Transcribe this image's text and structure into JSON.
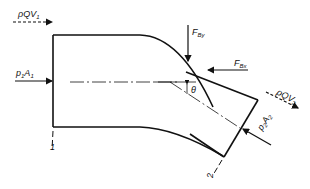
{
  "diagram": {
    "labels": {
      "momentum_in": "ρQV",
      "momentum_in_sub": "1",
      "pressure_in": "p",
      "pressure_in_sub": "1",
      "area_in": "A",
      "area_in_sub": "1",
      "force_y": "F",
      "force_y_sub": "By",
      "force_x": "F",
      "force_x_sub": "Bx",
      "momentum_out": "ρQV",
      "momentum_out_sub": "2",
      "pressure_out": "p",
      "pressure_out_sub": "2",
      "area_out": "A",
      "area_out_sub": "2",
      "angle": "θ",
      "section_1": "1",
      "section_2": "2"
    },
    "colors": {
      "ink": "#111111",
      "background": "#ffffff"
    }
  }
}
